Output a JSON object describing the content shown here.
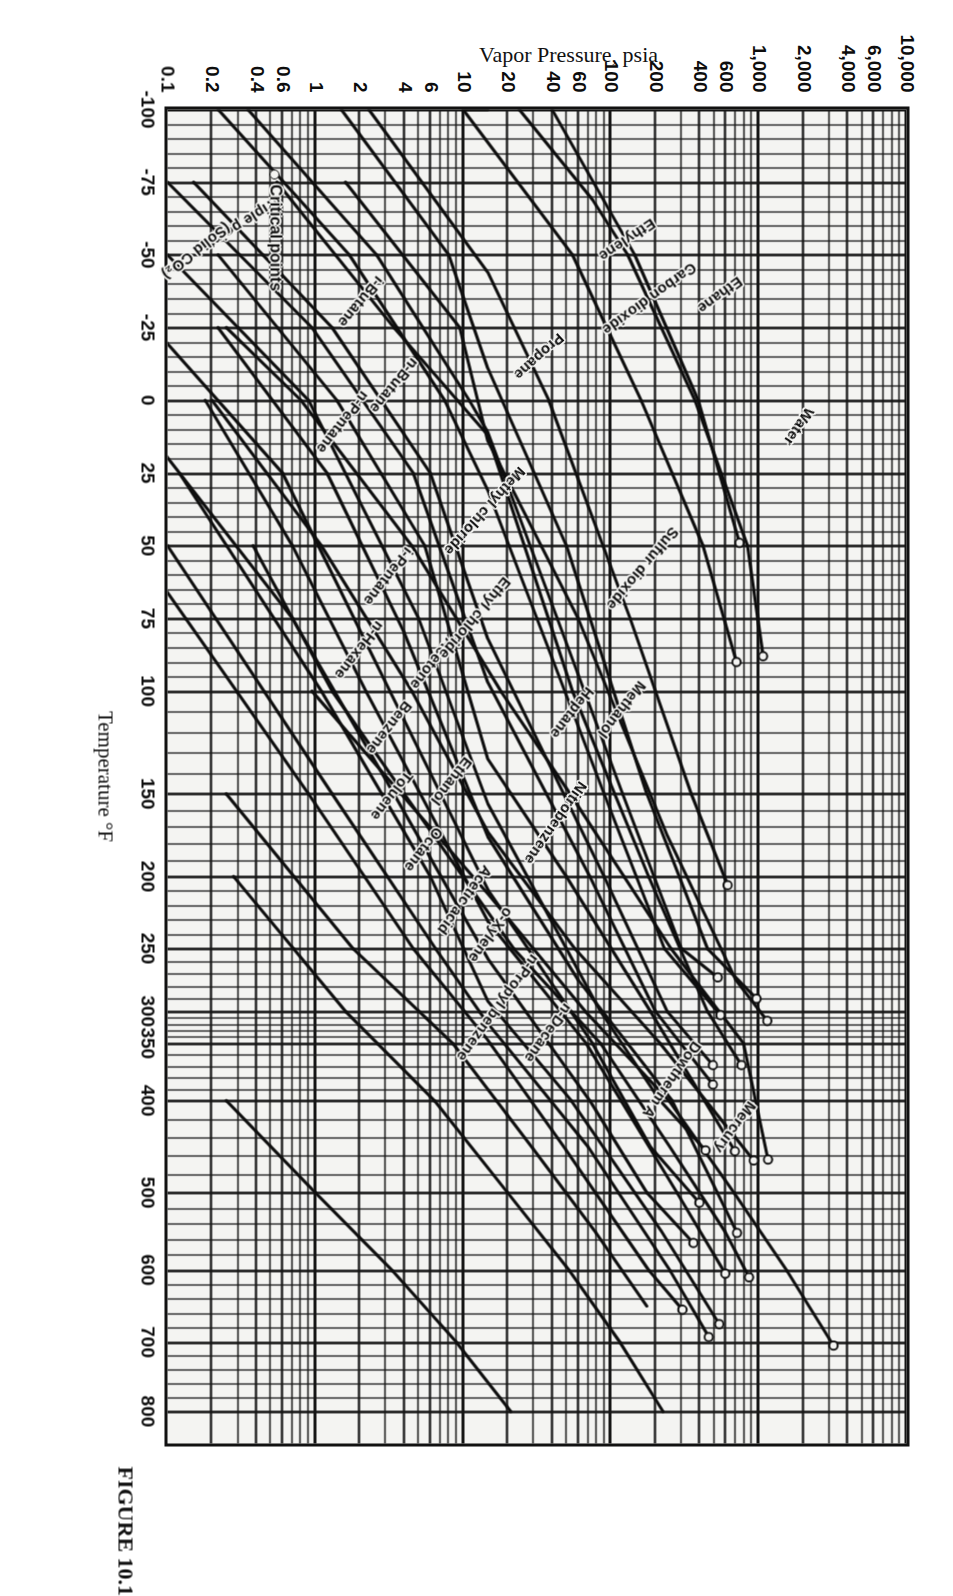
{
  "figure": {
    "caption": "FIGURE 10.1"
  },
  "axes": {
    "x_title": "Temperature °F",
    "y_title": "Vapor Pressure, psia",
    "x_ticks": [
      "-100",
      "-75",
      "-50",
      "-25",
      "0",
      "25",
      "50",
      "75",
      "100",
      "150",
      "200",
      "250",
      "300",
      "350",
      "400",
      "500",
      "600",
      "700",
      "800"
    ],
    "y_ticks": [
      "10,000",
      "6,000",
      "4,000",
      "2,000",
      "1,000",
      "600",
      "400",
      "200",
      "100",
      "60",
      "40",
      "20",
      "10",
      "6",
      "4",
      "2",
      "1",
      "0.6",
      "0.4",
      "0.2",
      "0.1"
    ]
  },
  "legend": {
    "critical_points": "Critical points"
  },
  "annotations": {
    "triple_point": "Triple point",
    "solid_co2": "(Solid CO₂)"
  },
  "chart_data": {
    "type": "line",
    "title": "FIGURE 10.1",
    "xlabel": "Temperature °F",
    "ylabel": "Vapor Pressure, psia",
    "xscale": "cox",
    "yscale": "log",
    "xlim": [
      -100,
      800
    ],
    "ylim": [
      0.1,
      10000
    ],
    "grid": true,
    "legend_position": "inside-lower-left",
    "x_tick_values": [
      -100,
      -75,
      -50,
      -25,
      0,
      25,
      50,
      75,
      100,
      150,
      200,
      250,
      300,
      350,
      400,
      500,
      600,
      700,
      800
    ],
    "y_tick_values": [
      10000,
      6000,
      4000,
      2000,
      1000,
      600,
      400,
      200,
      100,
      60,
      40,
      20,
      10,
      6,
      4,
      2,
      1,
      0.6,
      0.4,
      0.2,
      0.1
    ],
    "series": [
      {
        "name": "Water",
        "points": [
          [
            100,
            0.95
          ],
          [
            212,
            14.7
          ],
          [
            300,
            67
          ],
          [
            400,
            247
          ],
          [
            500,
            681
          ],
          [
            600,
            1543
          ],
          [
            705,
            3208
          ]
        ],
        "critical_point": [
          705,
          3208
        ],
        "label_t": 310
      },
      {
        "name": "Mercury",
        "points": [
          [
            300,
            0.0
          ],
          [
            400,
            0.25
          ],
          [
            500,
            1.0
          ],
          [
            600,
            3.3
          ],
          [
            700,
            9.0
          ],
          [
            800,
            21
          ]
        ],
        "label_t": 545
      },
      {
        "name": "Dowtherm A",
        "points": [
          [
            200,
            0.28
          ],
          [
            300,
            1.6
          ],
          [
            400,
            6.4
          ],
          [
            500,
            20
          ],
          [
            600,
            52
          ],
          [
            700,
            115
          ],
          [
            800,
            225
          ]
        ],
        "label_t": 520
      },
      {
        "name": "Nitrobenzene",
        "points": [
          [
            150,
            0.25
          ],
          [
            250,
            1.8
          ],
          [
            350,
            8.5
          ],
          [
            450,
            29
          ],
          [
            550,
            78
          ],
          [
            650,
            175
          ]
        ],
        "label_t": 285
      },
      {
        "name": "Acetic acid",
        "points": [
          [
            50,
            0.38
          ],
          [
            100,
            1.3
          ],
          [
            150,
            4.0
          ],
          [
            250,
            22
          ],
          [
            350,
            85
          ],
          [
            450,
            250
          ],
          [
            550,
            590
          ],
          [
            610,
            860
          ]
        ],
        "critical_point": [
          610,
          860
        ],
        "label_t": 110
      },
      {
        "name": "Methanol",
        "points": [
          [
            -25,
            0.25
          ],
          [
            0,
            0.8
          ],
          [
            50,
            4.5
          ],
          [
            100,
            18
          ],
          [
            150,
            53
          ],
          [
            250,
            255
          ],
          [
            350,
            790
          ],
          [
            464,
            1157
          ]
        ],
        "critical_point": [
          464,
          1157
        ],
        "label_t": 200
      },
      {
        "name": "Ethanol",
        "points": [
          [
            0,
            0.2
          ],
          [
            50,
            1.1
          ],
          [
            100,
            4.5
          ],
          [
            173,
            14.7
          ],
          [
            250,
            57
          ],
          [
            350,
            215
          ],
          [
            465,
            927
          ]
        ],
        "critical_point": [
          465,
          927
        ],
        "label_t": 55
      },
      {
        "name": "Acetone",
        "points": [
          [
            -50,
            0.22
          ],
          [
            0,
            1.4
          ],
          [
            50,
            5.5
          ],
          [
            133,
            14.7
          ],
          [
            200,
            50
          ],
          [
            300,
            185
          ],
          [
            455,
            691
          ]
        ],
        "critical_point": [
          455,
          691
        ],
        "label_t": 25
      },
      {
        "name": "Benzene",
        "points": [
          [
            -25,
            0.22
          ],
          [
            25,
            1.2
          ],
          [
            80,
            4.0
          ],
          [
            176,
            14.7
          ],
          [
            275,
            60
          ],
          [
            400,
            260
          ],
          [
            552,
            714
          ]
        ],
        "critical_point": [
          552,
          714
        ],
        "label_t": 30
      },
      {
        "name": "Toluene",
        "points": [
          [
            0,
            0.18
          ],
          [
            50,
            0.7
          ],
          [
            100,
            2.2
          ],
          [
            231,
            14.7
          ],
          [
            350,
            68
          ],
          [
            500,
            280
          ],
          [
            605,
            595
          ]
        ],
        "critical_point": [
          605,
          595
        ],
        "label_t": 42
      },
      {
        "name": "o-Xylene",
        "points": [
          [
            25,
            0.12
          ],
          [
            100,
            1.1
          ],
          [
            200,
            6.0
          ],
          [
            292,
            14.7
          ],
          [
            400,
            54
          ],
          [
            550,
            220
          ],
          [
            675,
            541
          ]
        ],
        "critical_point": [
          675,
          541
        ],
        "label_t": 112
      },
      {
        "name": "n-Propyl benzene",
        "points": [
          [
            50,
            0.1
          ],
          [
            150,
            1.3
          ],
          [
            250,
            6.5
          ],
          [
            319,
            14.7
          ],
          [
            450,
            70
          ],
          [
            600,
            250
          ],
          [
            693,
            460
          ]
        ],
        "critical_point": [
          693,
          460
        ],
        "label_t": 133
      },
      {
        "name": "n-Decane",
        "points": [
          [
            50,
            0.06
          ],
          [
            150,
            0.9
          ],
          [
            250,
            4.6
          ],
          [
            345,
            14.7
          ],
          [
            450,
            48
          ],
          [
            600,
            180
          ],
          [
            655,
            305
          ]
        ],
        "critical_point": [
          655,
          305
        ],
        "label_t": 180
      },
      {
        "name": "Octane",
        "points": [
          [
            0,
            0.05
          ],
          [
            75,
            0.7
          ],
          [
            150,
            3.4
          ],
          [
            258,
            14.7
          ],
          [
            400,
            72
          ],
          [
            500,
            175
          ],
          [
            565,
            362
          ]
        ],
        "critical_point": [
          565,
          362
        ],
        "label_t": 60
      },
      {
        "name": "Heptane",
        "points": [
          [
            -25,
            0.08
          ],
          [
            25,
            0.6
          ],
          [
            100,
            3.2
          ],
          [
            209,
            14.7
          ],
          [
            350,
            75
          ],
          [
            450,
            185
          ],
          [
            513,
            397
          ]
        ],
        "critical_point": [
          513,
          397
        ],
        "label_t": 195
      },
      {
        "name": "n-Hexane",
        "points": [
          [
            -50,
            0.1
          ],
          [
            0,
            0.9
          ],
          [
            75,
            5.0
          ],
          [
            156,
            14.7
          ],
          [
            300,
            85
          ],
          [
            400,
            215
          ],
          [
            454,
            437
          ]
        ],
        "critical_point": [
          454,
          437
        ],
        "label_t": 15
      },
      {
        "name": "i-Pentane",
        "points": [
          [
            -75,
            0.15
          ],
          [
            -25,
            1.3
          ],
          [
            25,
            6.0
          ],
          [
            82,
            14.7
          ],
          [
            200,
            90
          ],
          [
            300,
            240
          ],
          [
            369,
            490
          ]
        ],
        "critical_point": [
          369,
          490
        ],
        "label_t": -10
      },
      {
        "name": "n-Pentane",
        "points": [
          [
            -75,
            0.1
          ],
          [
            -25,
            0.95
          ],
          [
            25,
            4.6
          ],
          [
            97,
            14.7
          ],
          [
            200,
            72
          ],
          [
            300,
            200
          ],
          [
            386,
            490
          ]
        ],
        "critical_point": [
          386,
          490
        ],
        "label_t": -58
      },
      {
        "name": "n-Butane",
        "points": [
          [
            -100,
            0.22
          ],
          [
            -50,
            1.7
          ],
          [
            0,
            7.5
          ],
          [
            31,
            14.7
          ],
          [
            150,
            90
          ],
          [
            250,
            230
          ],
          [
            306,
            551
          ]
        ],
        "critical_point": [
          306,
          551
        ],
        "label_t": -55
      },
      {
        "name": "i-Butane",
        "points": [
          [
            -100,
            0.35
          ],
          [
            -50,
            2.6
          ],
          [
            0,
            11
          ],
          [
            11,
            14.7
          ],
          [
            150,
            120
          ],
          [
            250,
            300
          ],
          [
            273,
            529
          ]
        ],
        "critical_point": [
          273,
          529
        ],
        "label_t": -80
      },
      {
        "name": "Ethyl chloride",
        "points": [
          [
            -75,
            0.55
          ],
          [
            -25,
            3.4
          ],
          [
            12,
            14.7
          ],
          [
            100,
            55
          ],
          [
            200,
            180
          ],
          [
            300,
            450
          ],
          [
            369,
            764
          ]
        ],
        "critical_point": [
          369,
          764
        ],
        "label_t": 10
      },
      {
        "name": "Methyl chloride",
        "points": [
          [
            -100,
            1.5
          ],
          [
            -50,
            8.0
          ],
          [
            -11,
            14.7
          ],
          [
            50,
            50
          ],
          [
            150,
            175
          ],
          [
            250,
            450
          ],
          [
            290,
            968
          ]
        ],
        "critical_point": [
          290,
          968
        ],
        "label_t": -35
      },
      {
        "name": "Sulfur dioxide",
        "points": [
          [
            -75,
            1.6
          ],
          [
            -25,
            9.5
          ],
          [
            14,
            14.7
          ],
          [
            75,
            60
          ],
          [
            175,
            240
          ],
          [
            275,
            700
          ],
          [
            315,
            1143
          ]
        ],
        "critical_point": [
          315,
          1143
        ],
        "label_t": 200
      },
      {
        "name": "Propane",
        "points": [
          [
            -100,
            2.3
          ],
          [
            -44,
            14.7
          ],
          [
            0,
            38
          ],
          [
            75,
            135
          ],
          [
            150,
            350
          ],
          [
            206,
            617
          ]
        ],
        "critical_point": [
          206,
          617
        ],
        "label_t": -55
      },
      {
        "name": "Carbon dioxide",
        "points": [
          [
            -100,
            24
          ],
          [
            -69,
            75
          ],
          [
            -50,
            130
          ],
          [
            0,
            370
          ],
          [
            50,
            840
          ],
          [
            88,
            1071
          ]
        ],
        "critical_point": [
          88,
          1071
        ],
        "label_t": -60
      },
      {
        "name": "Ethane",
        "points": [
          [
            -100,
            10
          ],
          [
            -127,
            14.7
          ],
          [
            -50,
            55
          ],
          [
            0,
            160
          ],
          [
            50,
            420
          ],
          [
            90,
            708
          ]
        ],
        "critical_point": [
          90,
          708
        ],
        "label_t": -60
      },
      {
        "name": "Ethylene",
        "points": [
          [
            -100,
            40
          ],
          [
            -50,
            145
          ],
          [
            0,
            390
          ],
          [
            49,
            742
          ]
        ],
        "critical_point": [
          49,
          742
        ],
        "label_t": -80
      }
    ],
    "annotations": [
      {
        "text": "Critical points",
        "marker": "open-circle",
        "position": "legend"
      },
      {
        "text": "Triple point",
        "position": [
          -69,
          75
        ]
      },
      {
        "text": "(Solid CO₂)",
        "position": [
          -100,
          24
        ]
      }
    ]
  },
  "curve_labels": [
    {
      "name": "Water",
      "x": 0.225,
      "y": 0.118,
      "angle": 34
    },
    {
      "name": "Mercury",
      "x": 0.745,
      "y": 0.196,
      "angle": 36
    },
    {
      "name": "Dowtherm A",
      "x": 0.7,
      "y": 0.27,
      "angle": 35
    },
    {
      "name": "Nitrobenzene",
      "x": 0.505,
      "y": 0.425,
      "angle": 35
    },
    {
      "name": "Sulfur dioxide",
      "x": 0.315,
      "y": 0.3,
      "angle": 40
    },
    {
      "name": "Methanol",
      "x": 0.43,
      "y": 0.345,
      "angle": 38
    },
    {
      "name": "Heptane",
      "x": 0.435,
      "y": 0.415,
      "angle": 38
    },
    {
      "name": "Acetic acid",
      "x": 0.568,
      "y": 0.553,
      "angle": 36
    },
    {
      "name": "o-Xylene",
      "x": 0.6,
      "y": 0.525,
      "angle": 36
    },
    {
      "name": "n-Propyl benzene",
      "x": 0.635,
      "y": 0.49,
      "angle": 36
    },
    {
      "name": "n-Decane",
      "x": 0.672,
      "y": 0.445,
      "angle": 36
    },
    {
      "name": "Octane",
      "x": 0.54,
      "y": 0.62,
      "angle": 38
    },
    {
      "name": "Toluene",
      "x": 0.498,
      "y": 0.66,
      "angle": 38
    },
    {
      "name": "Ethanol",
      "x": 0.487,
      "y": 0.58,
      "angle": 38
    },
    {
      "name": "Benzene",
      "x": 0.445,
      "y": 0.662,
      "angle": 38
    },
    {
      "name": "Acetone",
      "x": 0.398,
      "y": 0.605,
      "angle": 38
    },
    {
      "name": "n-Hexane",
      "x": 0.385,
      "y": 0.7,
      "angle": 38
    },
    {
      "name": "i-Pentane",
      "x": 0.33,
      "y": 0.66,
      "angle": 38
    },
    {
      "name": "Ethyl chloride",
      "x": 0.352,
      "y": 0.528,
      "angle": 40
    },
    {
      "name": "Methyl chloride",
      "x": 0.27,
      "y": 0.508,
      "angle": 42
    },
    {
      "name": "n-Pentane",
      "x": 0.213,
      "y": 0.72,
      "angle": 38
    },
    {
      "name": "n-Butane",
      "x": 0.188,
      "y": 0.652,
      "angle": 40
    },
    {
      "name": "i-Butane",
      "x": 0.127,
      "y": 0.7,
      "angle": 40
    },
    {
      "name": "Propane",
      "x": 0.17,
      "y": 0.455,
      "angle": 48
    },
    {
      "name": "Ethane",
      "x": 0.128,
      "y": 0.212,
      "angle": 54
    },
    {
      "name": "Carbon dioxide",
      "x": 0.118,
      "y": 0.275,
      "angle": 54
    },
    {
      "name": "Ethylene",
      "x": 0.085,
      "y": 0.33,
      "angle": 56
    }
  ]
}
